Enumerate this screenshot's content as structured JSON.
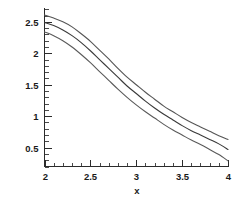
{
  "chart_data": {
    "type": "line",
    "title": "",
    "subtitle": "",
    "xlabel": "x",
    "ylabel": "",
    "xlim": [
      2,
      4
    ],
    "ylim": [
      0.2,
      2.72
    ],
    "grid": false,
    "legend": null,
    "legend_position": "none",
    "x_ticks": [
      2,
      2.5,
      3,
      3.5,
      4
    ],
    "x_tick_labels": [
      "2",
      "2.5",
      "3",
      "3.5",
      "4"
    ],
    "x_minor_step": 0.1,
    "y_ticks": [
      0.5,
      1,
      1.5,
      2,
      2.5
    ],
    "y_tick_labels": [
      "0.5",
      "1",
      "1.5",
      "2",
      "2.5"
    ],
    "y_minor_step": 0.1,
    "x": [
      2,
      2.1,
      2.2,
      2.3,
      2.4,
      2.5,
      2.6,
      2.7,
      2.8,
      2.9,
      3,
      3.1,
      3.2,
      3.3,
      3.4,
      3.5,
      3.6,
      3.7,
      3.8,
      3.9,
      4
    ],
    "series": [
      {
        "name": "upper",
        "color": "#555555",
        "values": [
          2.61,
          2.56,
          2.5,
          2.42,
          2.31,
          2.19,
          2.05,
          1.91,
          1.76,
          1.62,
          1.5,
          1.38,
          1.27,
          1.16,
          1.07,
          0.98,
          0.9,
          0.83,
          0.76,
          0.69,
          0.63
        ]
      },
      {
        "name": "middle",
        "color": "#3a3a3a",
        "values": [
          2.49,
          2.44,
          2.37,
          2.28,
          2.17,
          2.04,
          1.9,
          1.76,
          1.62,
          1.48,
          1.36,
          1.24,
          1.13,
          1.03,
          0.94,
          0.85,
          0.77,
          0.7,
          0.63,
          0.56,
          0.47
        ]
      },
      {
        "name": "lower",
        "color": "#5a5a5a",
        "values": [
          2.34,
          2.28,
          2.2,
          2.1,
          1.98,
          1.85,
          1.71,
          1.57,
          1.43,
          1.3,
          1.18,
          1.07,
          0.97,
          0.87,
          0.78,
          0.7,
          0.62,
          0.55,
          0.47,
          0.39,
          0.29
        ]
      }
    ]
  },
  "figure": {
    "background_color": "#ffffff",
    "axis_color": "#2b2b2b"
  }
}
